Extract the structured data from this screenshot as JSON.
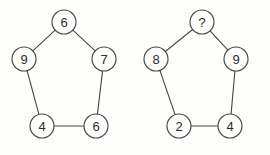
{
  "figure": {
    "type": "number-puzzle-diagram",
    "background_color": "#fdfdfc",
    "stroke_color": "#4a4a4a",
    "text_color": "#2b2b2b",
    "node_radius": 12,
    "shape": "pentagon"
  },
  "pentagons": [
    {
      "name": "left-pentagon",
      "nodes": [
        {
          "id": "L-top",
          "label": "6",
          "cx": 64,
          "cy": 22,
          "position": "top"
        },
        {
          "id": "L-right",
          "label": "7",
          "cx": 104,
          "cy": 59,
          "position": "upper-right"
        },
        {
          "id": "L-bottom-right",
          "label": "6",
          "cx": 96,
          "cy": 126,
          "position": "lower-right"
        },
        {
          "id": "L-bottom-left",
          "label": "4",
          "cx": 42,
          "cy": 126,
          "position": "lower-left"
        },
        {
          "id": "L-left",
          "label": "9",
          "cx": 24,
          "cy": 59,
          "position": "upper-left"
        }
      ],
      "edges": [
        [
          "L-top",
          "L-right"
        ],
        [
          "L-right",
          "L-bottom-right"
        ],
        [
          "L-bottom-right",
          "L-bottom-left"
        ],
        [
          "L-bottom-left",
          "L-left"
        ],
        [
          "L-left",
          "L-top"
        ]
      ]
    },
    {
      "name": "right-pentagon",
      "nodes": [
        {
          "id": "R-top",
          "label": "?",
          "cx": 202,
          "cy": 22,
          "position": "top"
        },
        {
          "id": "R-right",
          "label": "9",
          "cx": 236,
          "cy": 59,
          "position": "upper-right"
        },
        {
          "id": "R-bottom-right",
          "label": "4",
          "cx": 230,
          "cy": 126,
          "position": "lower-right"
        },
        {
          "id": "R-bottom-left",
          "label": "2",
          "cx": 179,
          "cy": 126,
          "position": "lower-left"
        },
        {
          "id": "R-left",
          "label": "8",
          "cx": 156,
          "cy": 59,
          "position": "upper-left"
        }
      ],
      "edges": [
        [
          "R-top",
          "R-right"
        ],
        [
          "R-right",
          "R-bottom-right"
        ],
        [
          "R-bottom-right",
          "R-bottom-left"
        ],
        [
          "R-bottom-left",
          "R-left"
        ],
        [
          "R-left",
          "R-top"
        ]
      ]
    }
  ]
}
